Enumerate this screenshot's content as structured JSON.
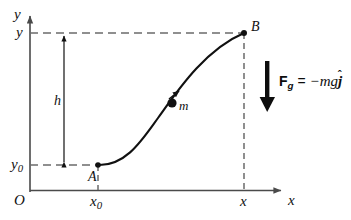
{
  "figure": {
    "kind": "physics-diagram",
    "background_color": "#ffffff",
    "stroke_color": "#111111",
    "dash_color": "#6b6b6b"
  },
  "axes": {
    "x_axis_label": "x",
    "y_axis_label": "y",
    "origin_label": "O"
  },
  "ticks": {
    "x": [
      {
        "id": "x0",
        "label": "x",
        "sub": "0"
      },
      {
        "id": "x",
        "label": "x",
        "sub": ""
      }
    ],
    "y": [
      {
        "id": "y0",
        "label": "y",
        "sub": "0"
      },
      {
        "id": "y",
        "label": "y",
        "sub": ""
      }
    ]
  },
  "points": {
    "start": {
      "label": "A"
    },
    "end": {
      "label": "B"
    },
    "particle": {
      "label": "m"
    }
  },
  "measurements": {
    "height": {
      "label": "h"
    }
  },
  "force": {
    "symbol": "F",
    "subscript": "g",
    "equals": "=",
    "expression": "−mg",
    "unit_vector": "j",
    "hat": "ˆ",
    "full_text": "F_g = −mgĵ",
    "direction": "down"
  }
}
